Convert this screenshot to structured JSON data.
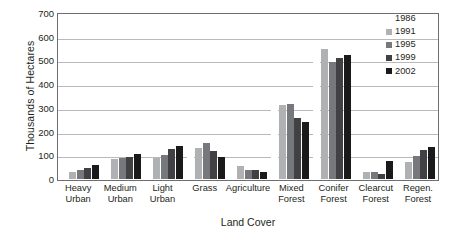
{
  "chart_data": {
    "type": "bar",
    "title": "",
    "xlabel": "Land Cover",
    "ylabel": "Thousands of Hectares",
    "ylim": [
      0,
      700
    ],
    "yticks": [
      700,
      600,
      500,
      400,
      300,
      200,
      100,
      0
    ],
    "grid": true,
    "legend_position": "top-right",
    "categories": [
      "Heavy Urban",
      "Medium Urban",
      "Light Urban",
      "Grass",
      "Agriculture",
      "Mixed Forest",
      "Conifer Forest",
      "Clearcut Forest",
      "Regen. Forest"
    ],
    "category_lines": [
      [
        "Heavy",
        "Urban"
      ],
      [
        "Medium",
        "Urban"
      ],
      [
        "Light",
        "Urban"
      ],
      [
        "Grass",
        ""
      ],
      [
        "Agriculture",
        ""
      ],
      [
        "Mixed",
        "Forest"
      ],
      [
        "Conifer",
        "Forest"
      ],
      [
        "Clearcut",
        "Forest"
      ],
      [
        "Regen.",
        "Forest"
      ]
    ],
    "series": [
      {
        "name": "1986",
        "color": "#ffffff",
        "values": [
          22,
          78,
          80,
          120,
          60,
          300,
          540,
          30,
          60
        ]
      },
      {
        "name": "1991",
        "color": "#b0b1b3",
        "values": [
          30,
          83,
          88,
          131,
          54,
          313,
          547,
          29,
          72
        ]
      },
      {
        "name": "1995",
        "color": "#77787b",
        "values": [
          38,
          90,
          100,
          151,
          38,
          317,
          495,
          28,
          99
        ]
      },
      {
        "name": "1999",
        "color": "#414042",
        "values": [
          48,
          91,
          127,
          118,
          36,
          258,
          512,
          23,
          121
        ]
      },
      {
        "name": "2002",
        "color": "#1a1a1a",
        "values": [
          57,
          104,
          141,
          92,
          30,
          240,
          522,
          74,
          137
        ]
      }
    ]
  }
}
